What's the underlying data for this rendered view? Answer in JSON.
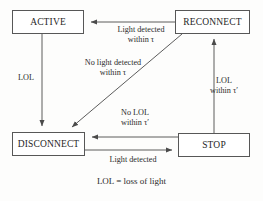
{
  "diagram": {
    "type": "state-transition-diagram",
    "caption": "LOL = loss of light",
    "states": [
      {
        "id": "active",
        "label": "ACTIVE"
      },
      {
        "id": "reconnect",
        "label": "RECONNECT"
      },
      {
        "id": "disconnect",
        "label": "DISCONNECT"
      },
      {
        "id": "stop",
        "label": "STOP"
      }
    ],
    "transitions": [
      {
        "id": "reconnect-to-active",
        "from": "RECONNECT",
        "to": "ACTIVE",
        "label_line1": "Light detected",
        "label_line2": "within τ"
      },
      {
        "id": "active-to-disconnect",
        "from": "ACTIVE",
        "to": "DISCONNECT",
        "label_line1": "LOL",
        "label_line2": ""
      },
      {
        "id": "reconnect-to-disconnect",
        "from": "RECONNECT",
        "to": "DISCONNECT",
        "label_line1": "No light detected",
        "label_line2": "within τ"
      },
      {
        "id": "stop-to-reconnect",
        "from": "STOP",
        "to": "RECONNECT",
        "label_line1": "LOL",
        "label_line2": "within τ′"
      },
      {
        "id": "stop-to-disconnect",
        "from": "STOP",
        "to": "DISCONNECT",
        "label_line1": "No LOL",
        "label_line2": "within τ′"
      },
      {
        "id": "disconnect-to-stop",
        "from": "DISCONNECT",
        "to": "STOP",
        "label_line1": "Light detected",
        "label_line2": ""
      }
    ],
    "colors": {
      "stroke": "#575757",
      "text": "#262626",
      "background": "#fdfdfc"
    }
  }
}
